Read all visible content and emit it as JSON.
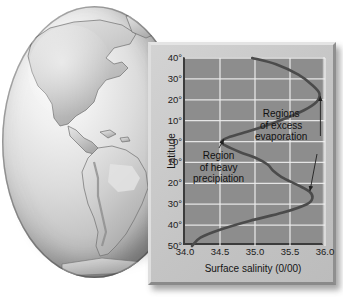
{
  "figure": {
    "alt_subject": "Earth globe showing the Americas next to a surface-salinity vs latitude graph"
  },
  "globe": {
    "name": "earth-globe-americas"
  },
  "chart_data": {
    "type": "line",
    "title": "",
    "xlabel": "Surface salinity (0/00)",
    "ylabel": "Latitude",
    "xlim": [
      34.0,
      36.0
    ],
    "ylim": [
      -50,
      40
    ],
    "grid": true,
    "legend": "none",
    "xticks": [
      34.0,
      34.5,
      35.0,
      35.5,
      36.0
    ],
    "xticklabels": [
      "34.0",
      "34.5",
      "35.0",
      "35.5",
      "36.0"
    ],
    "yticks": [
      40,
      30,
      20,
      10,
      0,
      -10,
      -20,
      -30,
      -40,
      -50
    ],
    "yticklabels": [
      "40°",
      "30°",
      "20°",
      "10°",
      "0°",
      "10°",
      "20°",
      "30°",
      "40°",
      "50°"
    ],
    "series": [
      {
        "name": "Surface salinity",
        "x": [
          34.96,
          35.3,
          35.62,
          35.82,
          35.92,
          35.88,
          35.7,
          35.35,
          34.92,
          34.62,
          34.52,
          34.58,
          34.78,
          35.02,
          35.18,
          35.26,
          35.38,
          35.62,
          35.78,
          35.82,
          35.74,
          35.4,
          34.92,
          34.52,
          34.22,
          34.1
        ],
        "y": [
          40,
          37,
          32,
          27,
          23,
          19,
          15,
          10,
          5,
          2,
          0,
          -2,
          -5,
          -8,
          -11,
          -14,
          -17,
          -21,
          -24,
          -27,
          -30,
          -34,
          -38,
          -42,
          -46,
          -50
        ]
      }
    ],
    "annotations": [
      {
        "name": "region-of-heavy-precipitation",
        "lines": [
          "Region",
          "of heavy",
          "precipiation"
        ],
        "target_x": 34.54,
        "target_y": 2
      },
      {
        "name": "regions-of-excess-evaporation",
        "lines": [
          "Regions",
          "of excess",
          "evaporation"
        ],
        "target_x": 35.92,
        "target_y": 23,
        "target2_x": 35.8,
        "target2_y": -25
      }
    ],
    "colors": {
      "plot_background": "#8d8d8d",
      "gridline": "#efefef",
      "curve": "#4b4b4b",
      "axis": "#3c3c3c",
      "panel": "#c9c9c9",
      "text": "#141414"
    }
  }
}
